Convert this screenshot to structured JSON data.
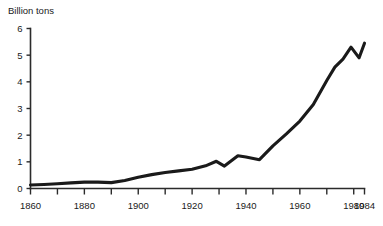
{
  "page": {
    "background_color": "#ffffff",
    "ink_color": "#1a1a1a"
  },
  "chart_data": {
    "type": "line",
    "title": "",
    "subtitle": "",
    "ylabel": "Billion tons",
    "xlabel": "",
    "axis_title_text": "Billion tons",
    "xlim": [
      1860,
      1984
    ],
    "ylim": [
      0,
      6
    ],
    "grid": false,
    "legend": false,
    "legend_position": "none",
    "series_color": "#1a1a1a",
    "y_ticks": [
      0,
      1,
      2,
      3,
      4,
      5,
      6
    ],
    "y_tick_labels": [
      "0",
      "1",
      "2",
      "3",
      "4",
      "5",
      "6"
    ],
    "x_ticks": [
      1860,
      1870,
      1880,
      1890,
      1900,
      1910,
      1920,
      1930,
      1940,
      1950,
      1960,
      1970,
      1980,
      1984
    ],
    "x_tick_labels": [
      "1860",
      "1880",
      "1900",
      "1920",
      "1940",
      "1960",
      "1980",
      "1984"
    ],
    "x_labeled_ticks": [
      1860,
      1880,
      1900,
      1920,
      1940,
      1960,
      1980,
      1984
    ],
    "x": [
      1860,
      1865,
      1870,
      1875,
      1880,
      1885,
      1890,
      1895,
      1900,
      1905,
      1910,
      1915,
      1920,
      1925,
      1929,
      1932,
      1937,
      1940,
      1945,
      1950,
      1955,
      1960,
      1965,
      1970,
      1973,
      1976,
      1979,
      1982,
      1984
    ],
    "values": [
      0.13,
      0.15,
      0.18,
      0.21,
      0.24,
      0.24,
      0.22,
      0.3,
      0.42,
      0.52,
      0.6,
      0.66,
      0.72,
      0.85,
      1.02,
      0.84,
      1.23,
      1.18,
      1.08,
      1.6,
      2.05,
      2.53,
      3.15,
      4.05,
      4.55,
      4.85,
      5.3,
      4.9,
      5.45
    ],
    "annotations": []
  }
}
